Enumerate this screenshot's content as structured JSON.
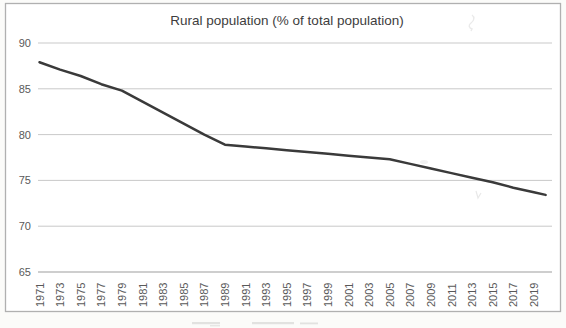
{
  "figure": {
    "title": "Rural population (% of total population)"
  },
  "chart_data": {
    "type": "line",
    "title": "Rural population (% of total population)",
    "categories": [
      "1971",
      "1973",
      "1975",
      "1977",
      "1979",
      "1981",
      "1983",
      "1985",
      "1987",
      "1989",
      "1991",
      "1993",
      "1995",
      "1997",
      "1999",
      "2001",
      "2003",
      "2005",
      "2007",
      "2009",
      "2011",
      "2013",
      "2015",
      "2017",
      "2019"
    ],
    "values": [
      87.9,
      87.1,
      86.4,
      85.5,
      84.8,
      83.6,
      82.4,
      81.2,
      80.0,
      78.9,
      78.7,
      78.5,
      78.3,
      78.1,
      77.9,
      77.7,
      77.5,
      77.3,
      76.8,
      76.3,
      75.8,
      75.3,
      74.8,
      74.2,
      73.7
    ],
    "xlabel": "",
    "ylabel": "",
    "ylim": [
      65,
      90
    ],
    "yticks": [
      90,
      85,
      80,
      75,
      70,
      65
    ],
    "x_tick_rotation": 90,
    "grid": "horizontal",
    "legend": "none",
    "colors": {
      "line": "#3a3a3a",
      "grid": "#c9c9c9",
      "axis": "#9e9e9e",
      "tick_labels": "#595959",
      "title": "#3d3d3d",
      "border": "#b0b0b0",
      "plot_background": "#ffffff"
    }
  }
}
